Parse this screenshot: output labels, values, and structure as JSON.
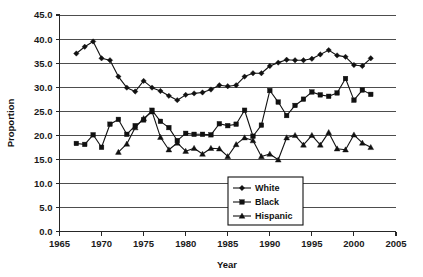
{
  "chart_data": {
    "type": "line",
    "title": "",
    "subtitle": "",
    "xlabel": "Year",
    "ylabel": "Proportion",
    "xlim": [
      1965,
      2005
    ],
    "ylim": [
      0.0,
      45.0
    ],
    "xticks": [
      1965,
      1970,
      1975,
      1980,
      1985,
      1990,
      1995,
      2000,
      2005
    ],
    "yticks": [
      0.0,
      5.0,
      10.0,
      15.0,
      20.0,
      25.0,
      30.0,
      35.0,
      40.0,
      45.0
    ],
    "xtick_labels": [
      "1965",
      "1970",
      "1975",
      "1980",
      "1985",
      "1990",
      "1995",
      "2000",
      "2005"
    ],
    "ytick_labels": [
      "0.0",
      "5.0",
      "10.0",
      "15.0",
      "20.0",
      "25.0",
      "30.0",
      "35.0",
      "40.0",
      "45.0"
    ],
    "grid": "horizontal",
    "legend_position": "lower-center-right",
    "line_color": "#111111",
    "grid_color": "#4d4d4d",
    "background_color": "#ffffff",
    "series": [
      {
        "name": "White",
        "marker": "diamond",
        "x": [
          1967,
          1968,
          1969,
          1970,
          1971,
          1972,
          1973,
          1974,
          1975,
          1976,
          1977,
          1978,
          1979,
          1980,
          1981,
          1982,
          1983,
          1984,
          1985,
          1986,
          1987,
          1988,
          1989,
          1990,
          1991,
          1992,
          1993,
          1994,
          1995,
          1996,
          1997,
          1998,
          1999,
          2000,
          2001,
          2002
        ],
        "y": [
          37.0,
          38.4,
          39.5,
          36.0,
          35.6,
          32.2,
          29.9,
          29.1,
          31.3,
          29.9,
          29.2,
          28.2,
          27.3,
          28.4,
          28.7,
          28.9,
          29.5,
          30.4,
          30.2,
          30.4,
          32.2,
          32.9,
          32.9,
          34.4,
          35.1,
          35.7,
          35.6,
          35.6,
          35.9,
          36.8,
          37.7,
          36.6,
          36.3,
          34.6,
          34.4,
          36.0
        ]
      },
      {
        "name": "Black",
        "marker": "square",
        "x": [
          1967,
          1968,
          1969,
          1970,
          1971,
          1972,
          1973,
          1974,
          1975,
          1976,
          1977,
          1978,
          1979,
          1980,
          1981,
          1982,
          1983,
          1984,
          1985,
          1986,
          1987,
          1988,
          1989,
          1990,
          1991,
          1992,
          1993,
          1994,
          1995,
          1996,
          1997,
          1998,
          1999,
          2000,
          2001,
          2002
        ],
        "y": [
          18.3,
          18.1,
          20.1,
          17.5,
          22.3,
          23.3,
          20.2,
          22.0,
          23.2,
          25.2,
          22.9,
          21.6,
          18.9,
          20.4,
          20.2,
          20.2,
          20.1,
          22.4,
          22.0,
          22.3,
          25.2,
          19.8,
          22.1,
          29.3,
          26.9,
          24.1,
          26.2,
          27.5,
          29.0,
          28.4,
          28.1,
          28.8,
          31.8,
          27.3,
          29.4,
          28.5
        ]
      },
      {
        "name": "Hispanic",
        "marker": "triangle",
        "x": [
          1972,
          1973,
          1974,
          1975,
          1976,
          1977,
          1978,
          1979,
          1980,
          1981,
          1982,
          1983,
          1984,
          1985,
          1986,
          1987,
          1988,
          1989,
          1990,
          1991,
          1992,
          1993,
          1994,
          1995,
          1996,
          1997,
          1998,
          1999,
          2000,
          2001,
          2002
        ],
        "y": [
          16.5,
          18.2,
          21.6,
          23.5,
          24.9,
          19.6,
          17.0,
          18.4,
          16.7,
          17.3,
          16.1,
          17.3,
          17.2,
          15.6,
          18.1,
          19.5,
          18.9,
          15.6,
          16.1,
          14.9,
          19.5,
          20.0,
          18.0,
          20.0,
          18.0,
          20.6,
          17.2,
          17.0,
          20.1,
          18.4,
          17.5
        ]
      }
    ]
  },
  "legend": {
    "entries": [
      {
        "label": "White"
      },
      {
        "label": "Black"
      },
      {
        "label": "Hispanic"
      }
    ]
  },
  "axes": {
    "x_title": "Year",
    "y_title": "Proportion"
  }
}
